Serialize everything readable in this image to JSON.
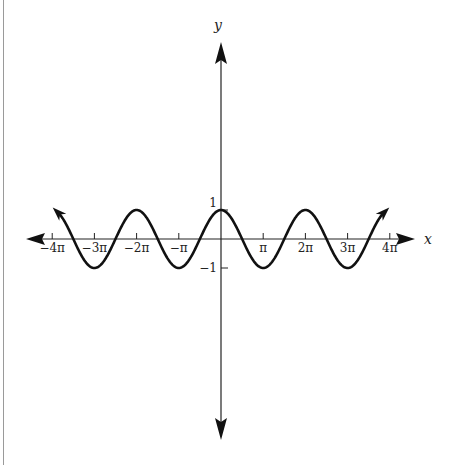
{
  "chart_data": {
    "type": "line",
    "title": "",
    "function": "y = cos(x)",
    "xlabel": "x",
    "ylabel": "y",
    "x_ticks": [
      {
        "value": -12.566,
        "label": "−4π"
      },
      {
        "value": -9.425,
        "label": "−3π"
      },
      {
        "value": -6.283,
        "label": "−2π"
      },
      {
        "value": -3.1416,
        "label": "−π"
      },
      {
        "value": 3.1416,
        "label": "π"
      },
      {
        "value": 6.283,
        "label": "2π"
      },
      {
        "value": 9.425,
        "label": "3π"
      },
      {
        "value": 12.566,
        "label": "4π"
      }
    ],
    "y_ticks": [
      {
        "value": 1,
        "label": "1"
      },
      {
        "value": -1,
        "label": "−1"
      }
    ],
    "xlim": [
      -12.566,
      12.566
    ],
    "ylim": [
      -1,
      1
    ],
    "curve_domain": [
      -12.1,
      12.1
    ],
    "curve_end_arrows": true,
    "axis_arrows": true,
    "grid": false,
    "series": [
      {
        "name": "cos(x)",
        "x": [
          -12.1,
          -9.425,
          -6.283,
          -3.1416,
          0,
          3.1416,
          6.283,
          9.425,
          12.1
        ],
        "values": [
          0.89,
          -1,
          1,
          -1,
          1,
          -1,
          1,
          -1,
          0.89
        ]
      }
    ]
  },
  "colors": {
    "curve": "#111111",
    "axes": "#222222",
    "text": "#222222"
  }
}
